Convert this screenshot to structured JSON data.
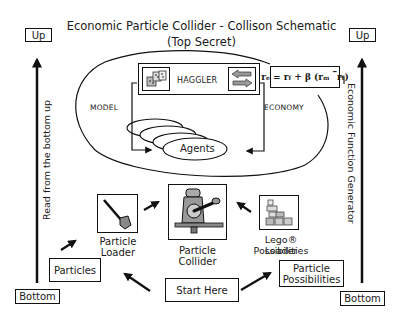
{
  "title": {
    "line1": "Economic Particle Collider  - Collison Schematic",
    "line2": "(Top Secret)"
  },
  "left_axis": {
    "top_label": "Up",
    "bottom_label": "Bottom",
    "side_text": "Read from the bottom up"
  },
  "right_axis": {
    "top_label": "Up",
    "bottom_label": "Bottom",
    "side_text": "Economic Function Generator"
  },
  "model_region": {
    "haggler_label": "HAGGLER",
    "model_label": "MODEL",
    "economy_label": "ECONOMY",
    "agents_label": "Agents",
    "formula": {
      "lhs": "r",
      "lhs_sub": "e",
      "rf": "r",
      "rf_sub": "f",
      "beta": "β",
      "rm": "r",
      "rm_sub": "m",
      "rf2": "r",
      "rf2_sub": "f"
    }
  },
  "flow": {
    "start": "Start Here",
    "particles": "Particles",
    "particle_possibilities_l1": "Particle",
    "particle_possibilities_l2": "Possibilities",
    "particle_loader_l1": "Particle",
    "particle_loader_l2": "Loader",
    "particle_collider_l1": "Particle",
    "particle_collider_l2": "Collider",
    "lego_loader_l1": "Lego® Possibilities",
    "lego_loader_l2": "Loader"
  }
}
